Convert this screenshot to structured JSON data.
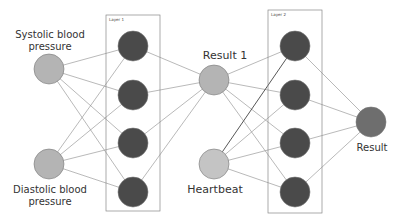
{
  "diagram": {
    "type": "neural-network",
    "colors": {
      "input_node": "#b4b4b4",
      "hidden_node": "#4a4a4a",
      "output_node": "#6e6e6e",
      "edge": "#888888",
      "box": "#888888"
    },
    "layers": [
      {
        "label": "Layer 1"
      },
      {
        "label": "Layer 2"
      }
    ],
    "labels": {
      "systolic": "Systolic blood\npressure",
      "diastolic": "Diastolic blood\npressure",
      "result1": "Result 1",
      "heartbeat": "Heartbeat",
      "result": "Result"
    }
  }
}
